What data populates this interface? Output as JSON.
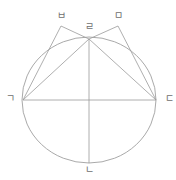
{
  "figure": {
    "type": "geometry-diagram",
    "stroke_color": "#9a9a9a",
    "label_color": "#6e6e6e",
    "background_color": "#ffffff",
    "width": 176,
    "height": 180
  },
  "labels": {
    "top_left": "ㅂ",
    "top_right": "ㅁ",
    "apex": "ㄹ",
    "left": "ㄱ",
    "right": "ㄷ",
    "bottom": "ㄴ"
  },
  "points": {
    "top_left": {
      "name": "ㅂ",
      "x": 61,
      "y": 26
    },
    "top_right": {
      "name": "ㅁ",
      "x": 118,
      "y": 26
    },
    "apex": {
      "name": "ㄹ",
      "x": 89,
      "y": 39
    },
    "left": {
      "name": "ㄱ",
      "x": 23,
      "y": 100
    },
    "right": {
      "name": "ㄷ",
      "x": 156,
      "y": 100
    },
    "bottom": {
      "name": "ㄴ",
      "x": 89,
      "y": 163
    },
    "center": {
      "name": "center",
      "x": 89,
      "y": 100
    }
  },
  "circle": {
    "cx": 89,
    "cy": 100,
    "rx": 67,
    "ry": 63
  },
  "segments": [
    {
      "name": "horizontal-diameter",
      "from": "left",
      "to": "right"
    },
    {
      "name": "vertical-diameter",
      "from": "apex",
      "to": "bottom"
    },
    {
      "name": "chord-left-apex",
      "from": "left",
      "to": "apex"
    },
    {
      "name": "chord-right-apex",
      "from": "right",
      "to": "apex"
    },
    {
      "name": "leg-left-upper",
      "from": "left",
      "to": "top_left"
    },
    {
      "name": "leg-upper-apex",
      "from": "top_left",
      "to": "apex"
    },
    {
      "name": "leg-right-upper",
      "from": "right",
      "to": "top_right"
    },
    {
      "name": "leg-upper-apex-right",
      "from": "top_right",
      "to": "apex"
    }
  ]
}
